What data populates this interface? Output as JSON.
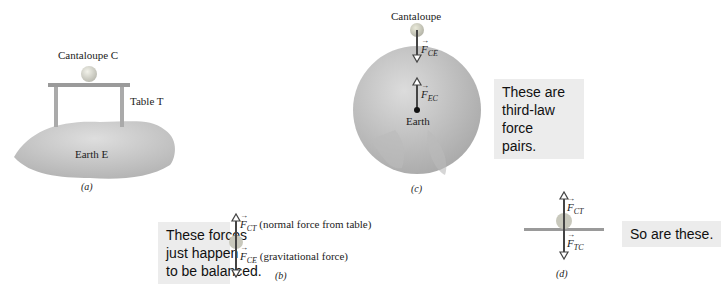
{
  "panels": {
    "a": {
      "caption": "(a)",
      "cantaloupe_label": "Cantaloupe C",
      "table_label": "Table T",
      "earth_label": "Earth E"
    },
    "b": {
      "caption": "(b)",
      "callout": [
        "These forces",
        "just happen",
        "to be balanced."
      ],
      "force_up": {
        "symbol": "F",
        "subscript": "CT",
        "description": "(normal force from table)"
      },
      "force_down": {
        "symbol": "F",
        "subscript": "CE",
        "description": "(gravitational force)"
      }
    },
    "c": {
      "caption": "(c)",
      "cantaloupe_label": "Cantaloupe",
      "earth_label": "Earth",
      "force_down": {
        "symbol": "F",
        "subscript": "CE"
      },
      "force_up": {
        "symbol": "F",
        "subscript": "EC"
      },
      "callout": [
        "These are",
        "third-law force",
        "pairs."
      ]
    },
    "d": {
      "caption": "(d)",
      "force_up": {
        "symbol": "F",
        "subscript": "CT"
      },
      "force_down": {
        "symbol": "F",
        "subscript": "TC"
      },
      "callout": "So are these."
    }
  },
  "colors": {
    "earth": "#c9c9c9",
    "earth_dark": "#a9a9a9",
    "table": "#9a9a9a",
    "cantaloupe": "#d4d4c8",
    "arrow": "#444444",
    "callout_bg": "#ececec"
  }
}
